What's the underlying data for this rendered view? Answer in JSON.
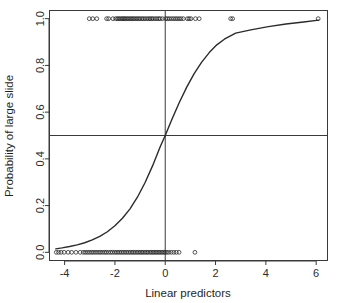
{
  "chart_data": {
    "type": "line",
    "title": "",
    "xlabel": "Linear predictors",
    "ylabel": "Probability of large slide",
    "xlim": [
      -4.6,
      6.45
    ],
    "ylim": [
      -0.035,
      1.035
    ],
    "grid": false,
    "legend": "none",
    "xticks": [
      -4,
      -2,
      0,
      2,
      4,
      6
    ],
    "xticklabels": [
      "-4",
      "-2",
      "0",
      "2",
      "4",
      "6"
    ],
    "yticks": [
      0.0,
      0.2,
      0.4,
      0.6,
      0.8,
      1.0
    ],
    "yticklabels": [
      "0.0",
      "0.2",
      "0.4",
      "0.6",
      "0.8",
      "1.0"
    ],
    "reference_lines": [
      {
        "name": "horizontal-p-half",
        "orientation": "horizontal",
        "value": 0.5
      },
      {
        "name": "vertical-zero",
        "orientation": "vertical",
        "value": 0.0
      }
    ],
    "series": [
      {
        "name": "fitted-logistic-curve",
        "type": "line",
        "x": [
          -4.35,
          -4.1,
          -3.8,
          -3.5,
          -3.2,
          -2.9,
          -2.6,
          -2.3,
          -2.0,
          -1.7,
          -1.4,
          -1.1,
          -0.8,
          -0.5,
          -0.2,
          0.0,
          0.25,
          0.55,
          0.85,
          1.15,
          1.45,
          1.75,
          2.05,
          2.35,
          2.8,
          3.4,
          4.1,
          4.8,
          5.5,
          6.1
        ],
        "y": [
          0.015,
          0.019,
          0.025,
          0.032,
          0.041,
          0.053,
          0.068,
          0.088,
          0.114,
          0.146,
          0.186,
          0.237,
          0.299,
          0.371,
          0.452,
          0.5,
          0.565,
          0.639,
          0.706,
          0.765,
          0.814,
          0.855,
          0.888,
          0.912,
          0.938,
          0.952,
          0.966,
          0.977,
          0.986,
          0.994
        ]
      },
      {
        "name": "rug-observations-outcome-1",
        "type": "scatter",
        "y_value": 1.0,
        "marker": "open-circle",
        "x": [
          -3.02,
          -2.88,
          -2.72,
          -2.33,
          -2.25,
          -2.08,
          -1.97,
          -1.9,
          -1.85,
          -1.79,
          -1.73,
          -1.68,
          -1.63,
          -1.58,
          -1.52,
          -1.47,
          -1.41,
          -1.35,
          -1.3,
          -1.24,
          -1.18,
          -1.12,
          -1.06,
          -1.0,
          -0.93,
          -0.87,
          -0.8,
          -0.73,
          -0.66,
          -0.6,
          -0.54,
          -0.48,
          -0.4,
          -0.33,
          -0.26,
          -0.2,
          -0.11,
          0.02,
          0.09,
          0.16,
          0.24,
          0.32,
          0.4,
          0.47,
          0.55,
          0.63,
          0.72,
          0.88,
          0.95,
          1.02,
          1.2,
          1.35,
          2.6,
          2.68,
          6.08
        ]
      },
      {
        "name": "rug-observations-outcome-0",
        "type": "scatter",
        "y_value": 0.0,
        "marker": "open-circle",
        "x": [
          -4.33,
          -4.24,
          -4.14,
          -4.02,
          -3.86,
          -3.72,
          -3.55,
          -3.38,
          -3.26,
          -3.18,
          -3.1,
          -3.02,
          -2.94,
          -2.87,
          -2.79,
          -2.71,
          -2.63,
          -2.56,
          -2.48,
          -2.4,
          -2.33,
          -2.25,
          -2.17,
          -2.1,
          -2.02,
          -1.95,
          -1.88,
          -1.81,
          -1.74,
          -1.67,
          -1.6,
          -1.53,
          -1.46,
          -1.39,
          -1.32,
          -1.26,
          -1.19,
          -1.12,
          -1.06,
          -0.99,
          -0.93,
          -0.87,
          -0.8,
          -0.74,
          -0.68,
          -0.61,
          -0.55,
          -0.49,
          -0.43,
          -0.37,
          -0.31,
          -0.25,
          -0.19,
          -0.13,
          -0.07,
          -0.01,
          0.06,
          0.14,
          0.24,
          0.34,
          0.44,
          0.55,
          1.18
        ]
      }
    ]
  },
  "labels": {
    "x_axis_title": "Linear predictors",
    "y_axis_title": "Probability of large slide"
  },
  "colors": {
    "axis": "#3a3a3a",
    "curve": "#2b2b2b",
    "marker": "#1f1f1f",
    "background": "#ffffff"
  }
}
